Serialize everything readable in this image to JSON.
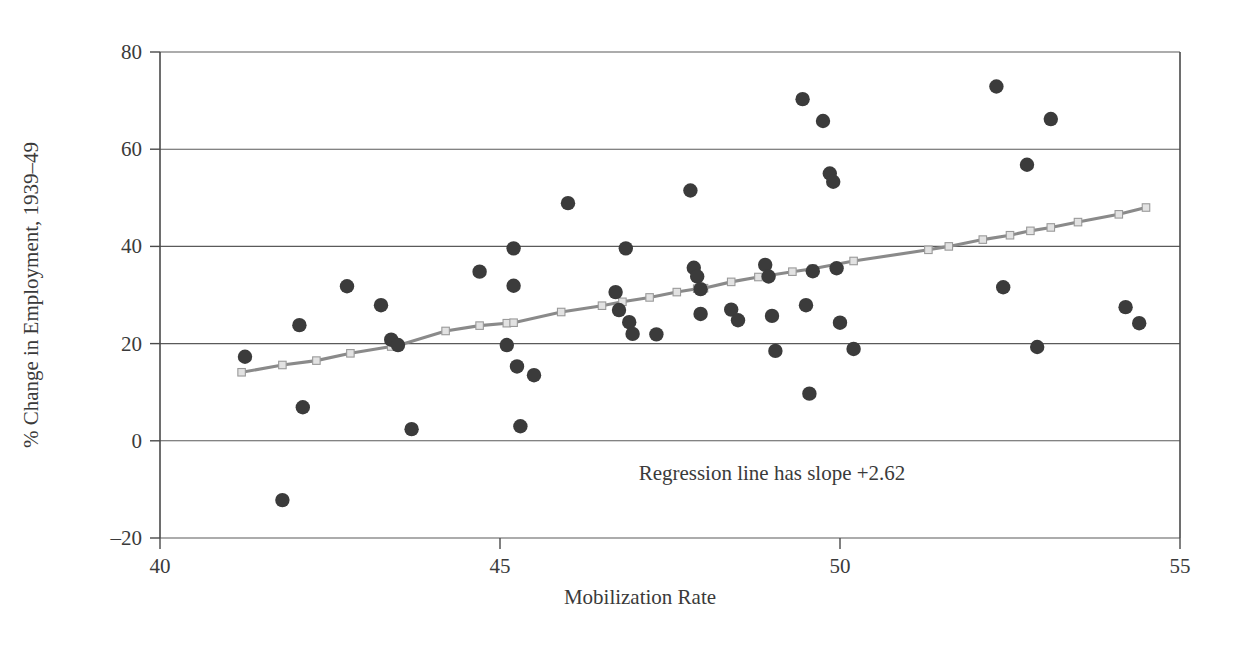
{
  "chart_data": {
    "type": "scatter",
    "title": "",
    "subtitle": "",
    "xlabel": "Mobilization Rate",
    "ylabel": "% Change in Employment, 1939–49",
    "xlim": [
      40,
      55
    ],
    "ylim": [
      -20,
      80
    ],
    "xticks": [
      40,
      45,
      50,
      55
    ],
    "xtick_labels": [
      "40",
      "45",
      "50",
      "55"
    ],
    "yticks": [
      -20,
      0,
      20,
      40,
      60,
      80
    ],
    "ytick_labels": [
      "–20",
      "0",
      "20",
      "40",
      "60",
      "80"
    ],
    "grid": "horizontal",
    "legend": "none",
    "annotations": [
      {
        "text": "Regression line has slope +2.62",
        "x": 49.0,
        "y": -8.0
      }
    ],
    "series": [
      {
        "name": "State observations",
        "type": "scatter",
        "marker": "filled-circle",
        "color": "#3b3b3b",
        "points": [
          [
            41.25,
            17.3
          ],
          [
            41.8,
            -12.2
          ],
          [
            42.05,
            23.8
          ],
          [
            42.1,
            6.9
          ],
          [
            42.75,
            31.8
          ],
          [
            43.25,
            27.9
          ],
          [
            43.4,
            20.8
          ],
          [
            43.5,
            19.7
          ],
          [
            43.7,
            2.4
          ],
          [
            44.7,
            34.8
          ],
          [
            45.1,
            19.7
          ],
          [
            45.2,
            39.6
          ],
          [
            45.2,
            31.9
          ],
          [
            45.25,
            15.3
          ],
          [
            45.3,
            3.0
          ],
          [
            45.5,
            13.5
          ],
          [
            46.0,
            48.9
          ],
          [
            46.7,
            30.6
          ],
          [
            46.75,
            26.9
          ],
          [
            46.85,
            39.6
          ],
          [
            46.9,
            24.4
          ],
          [
            46.95,
            22.0
          ],
          [
            47.3,
            21.9
          ],
          [
            47.8,
            51.5
          ],
          [
            47.85,
            35.6
          ],
          [
            47.9,
            33.8
          ],
          [
            47.95,
            31.2
          ],
          [
            47.95,
            26.1
          ],
          [
            48.4,
            27.0
          ],
          [
            48.5,
            24.8
          ],
          [
            48.9,
            36.2
          ],
          [
            48.95,
            33.8
          ],
          [
            49.0,
            25.7
          ],
          [
            49.05,
            18.5
          ],
          [
            49.45,
            70.3
          ],
          [
            49.5,
            27.9
          ],
          [
            49.55,
            9.7
          ],
          [
            49.6,
            34.9
          ],
          [
            49.75,
            65.8
          ],
          [
            49.85,
            55.0
          ],
          [
            49.9,
            53.3
          ],
          [
            49.95,
            35.5
          ],
          [
            50.0,
            24.3
          ],
          [
            50.2,
            18.9
          ],
          [
            52.3,
            72.9
          ],
          [
            52.4,
            31.6
          ],
          [
            52.75,
            56.8
          ],
          [
            52.9,
            19.3
          ],
          [
            53.1,
            66.2
          ],
          [
            54.2,
            27.5
          ],
          [
            54.4,
            24.2
          ]
        ]
      },
      {
        "name": "Regression line",
        "type": "line-with-markers",
        "marker": "open-square",
        "color": "#8a8a8a",
        "marker_color": "#e2e2e2",
        "slope": 2.62,
        "endpoints": [
          [
            41.2,
            14.1
          ],
          [
            54.5,
            48.0
          ]
        ],
        "marker_points": [
          [
            41.2,
            14.1
          ],
          [
            41.8,
            15.6
          ],
          [
            42.3,
            16.5
          ],
          [
            42.8,
            18.0
          ],
          [
            43.4,
            19.4
          ],
          [
            43.5,
            19.6
          ],
          [
            44.2,
            22.6
          ],
          [
            44.7,
            23.7
          ],
          [
            45.1,
            24.2
          ],
          [
            45.2,
            24.3
          ],
          [
            45.9,
            26.5
          ],
          [
            46.5,
            27.8
          ],
          [
            46.8,
            28.6
          ],
          [
            47.2,
            29.5
          ],
          [
            47.6,
            30.6
          ],
          [
            47.9,
            31.3
          ],
          [
            48.0,
            31.4
          ],
          [
            48.4,
            32.7
          ],
          [
            48.8,
            33.7
          ],
          [
            49.3,
            34.8
          ],
          [
            49.6,
            35.4
          ],
          [
            50.2,
            37.0
          ],
          [
            51.3,
            39.3
          ],
          [
            51.6,
            40.0
          ],
          [
            52.1,
            41.4
          ],
          [
            52.5,
            42.3
          ],
          [
            52.8,
            43.2
          ],
          [
            53.1,
            43.9
          ],
          [
            53.5,
            45.0
          ],
          [
            54.1,
            46.6
          ],
          [
            54.5,
            48.0
          ]
        ]
      }
    ]
  },
  "colors": {
    "dot": "#3b3b3b",
    "regression_line": "#8a8a8a",
    "regression_marker": "#e2e2e2",
    "axis": "#4a4a4a",
    "grid": "#5a5a5a",
    "text": "#3a3a3a",
    "background": "#ffffff"
  }
}
